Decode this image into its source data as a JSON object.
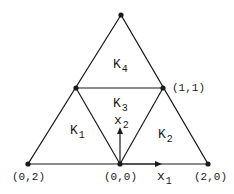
{
  "figure": {
    "elements": [
      {
        "id": "K1",
        "letter": "K",
        "index": "1"
      },
      {
        "id": "K2",
        "letter": "K",
        "index": "2"
      },
      {
        "id": "K3",
        "letter": "K",
        "index": "3"
      },
      {
        "id": "K4",
        "letter": "K",
        "index": "4"
      }
    ],
    "axes": {
      "x1": {
        "letter": "x",
        "index": "1"
      },
      "x2": {
        "letter": "x",
        "index": "2"
      }
    },
    "vertex_labels": {
      "origin": "(0,0)",
      "left": "(0,2)",
      "right": "(2,0)",
      "mid_right": "(1,1)"
    },
    "colors": {
      "line": "#1a1a1a",
      "background": "#ffffff"
    }
  }
}
